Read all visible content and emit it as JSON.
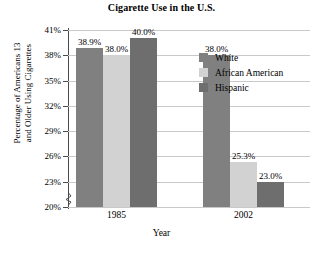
{
  "chart_data": {
    "type": "bar",
    "title": "Cigarette Use in the U.S.",
    "xlabel": "Year",
    "ylabel_lines": [
      "Percentage of Americans 13",
      "and Older Using Cigarettes"
    ],
    "categories": [
      "1985",
      "2002"
    ],
    "series": [
      {
        "name": "White",
        "values": [
          38.9,
          38.0
        ],
        "labels": [
          "38.9%",
          "38.0%"
        ],
        "color": "#808080"
      },
      {
        "name": "African American",
        "values": [
          38.0,
          25.3
        ],
        "labels": [
          "38.0%",
          "25.3%"
        ],
        "color": "#d2d2d2"
      },
      {
        "name": "Hispanic",
        "values": [
          40.0,
          23.0
        ],
        "labels": [
          "40.0%",
          "23.0%"
        ],
        "color": "#6e6e6e"
      }
    ],
    "ylim": [
      20,
      41
    ],
    "yticks": [
      20,
      23,
      26,
      29,
      32,
      35,
      38,
      41
    ],
    "ytick_labels": [
      "20%",
      "23%",
      "26%",
      "29%",
      "32%",
      "35%",
      "38%",
      "41%"
    ],
    "axis_break": true,
    "grid": true,
    "legend_position": "right"
  },
  "legend": {
    "items": [
      {
        "label": "White",
        "color": "#808080"
      },
      {
        "label": "African American",
        "color": "#d2d2d2"
      },
      {
        "label": "Hispanic",
        "color": "#6e6e6e"
      }
    ]
  },
  "colors": {
    "white_series": "#808080",
    "african_american_series": "#d2d2d2",
    "hispanic_series": "#6e6e6e",
    "gridline": "#c9c9c9",
    "axis": "#4a4a4a"
  }
}
